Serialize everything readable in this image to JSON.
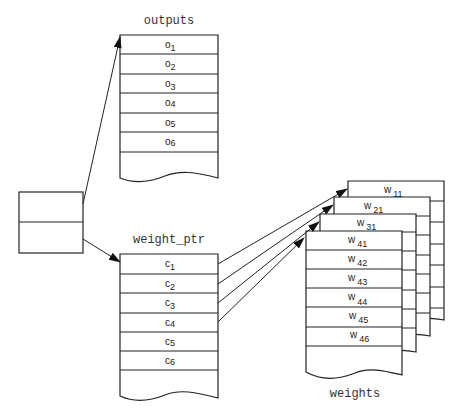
{
  "diagram": {
    "layer": {
      "label": "layer",
      "rows": 2
    },
    "outputs": {
      "label": "outputs",
      "cells": [
        {
          "base": "o",
          "sub": "1"
        },
        {
          "base": "o",
          "sub": "2"
        },
        {
          "base": "o",
          "sub": "3"
        },
        {
          "base": "o",
          "sub": "4"
        },
        {
          "base": "o",
          "sub": "5"
        },
        {
          "base": "o",
          "sub": "6"
        }
      ]
    },
    "weight_ptr": {
      "label": "weight_ptr",
      "cells": [
        {
          "base": "c",
          "sub": "1"
        },
        {
          "base": "c",
          "sub": "2"
        },
        {
          "base": "c",
          "sub": "3"
        },
        {
          "base": "c",
          "sub": "4"
        },
        {
          "base": "c",
          "sub": "5"
        },
        {
          "base": "c",
          "sub": "6"
        }
      ]
    },
    "weights": {
      "label": "weights",
      "sheets": [
        {
          "top": {
            "base": "w",
            "sub": "11"
          }
        },
        {
          "top": {
            "base": "w",
            "sub": "21"
          }
        },
        {
          "top": {
            "base": "w",
            "sub": "31"
          }
        },
        {
          "top": {
            "base": "w",
            "sub": "41"
          },
          "cells": [
            {
              "base": "w",
              "sub": "41"
            },
            {
              "base": "w",
              "sub": "42"
            },
            {
              "base": "w",
              "sub": "43"
            },
            {
              "base": "w",
              "sub": "44"
            },
            {
              "base": "w",
              "sub": "45"
            },
            {
              "base": "w",
              "sub": "46"
            }
          ]
        }
      ]
    },
    "arrows": [
      {
        "from": "layer.row1",
        "to": "outputs"
      },
      {
        "from": "layer.row2",
        "to": "weight_ptr"
      },
      {
        "from": "weight_ptr.c1",
        "to": "weights.sheet1"
      },
      {
        "from": "weight_ptr.c2",
        "to": "weights.sheet2"
      },
      {
        "from": "weight_ptr.c3",
        "to": "weights.sheet3"
      },
      {
        "from": "weight_ptr.c4",
        "to": "weights.sheet4"
      }
    ]
  }
}
